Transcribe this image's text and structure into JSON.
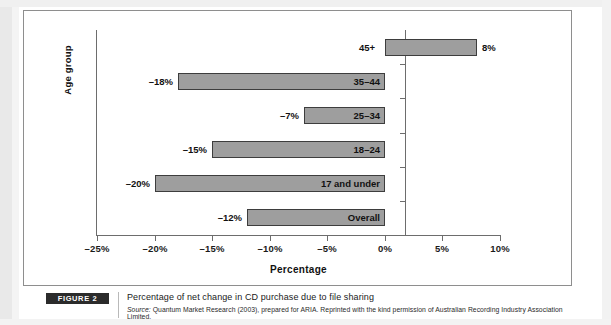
{
  "chart_data": {
    "type": "bar",
    "orientation": "horizontal",
    "title": "",
    "xlabel": "Percentage",
    "ylabel": "Age group",
    "xlim": [
      -25,
      10
    ],
    "xticks": [
      "–25%",
      "–20%",
      "–15%",
      "–10%",
      "–5%",
      "0%",
      "5%",
      "10%"
    ],
    "xtick_values": [
      -25,
      -20,
      -15,
      -10,
      -5,
      0,
      5,
      10
    ],
    "grid": false,
    "legend": null,
    "categories": [
      "45+",
      "35–44",
      "25–34",
      "18–24",
      "17 and under",
      "Overall"
    ],
    "values": [
      8,
      -18,
      -7,
      -15,
      -20,
      -12
    ],
    "value_labels": [
      "8%",
      "–18%",
      "–7%",
      "–15%",
      "–20%",
      "–12%"
    ],
    "bar_fill_color": "#9e9e9e",
    "bar_border_color": "#3d3d3d"
  },
  "caption": {
    "badge": "FIGURE 2",
    "title": "Percentage of net change in CD purchase due to file sharing",
    "source_prefix": "Source:",
    "source_text": " Quantum Market Research (2003), prepared for ARIA. Reprinted with the kind permission of Australian Recording Industry Association Limited."
  }
}
